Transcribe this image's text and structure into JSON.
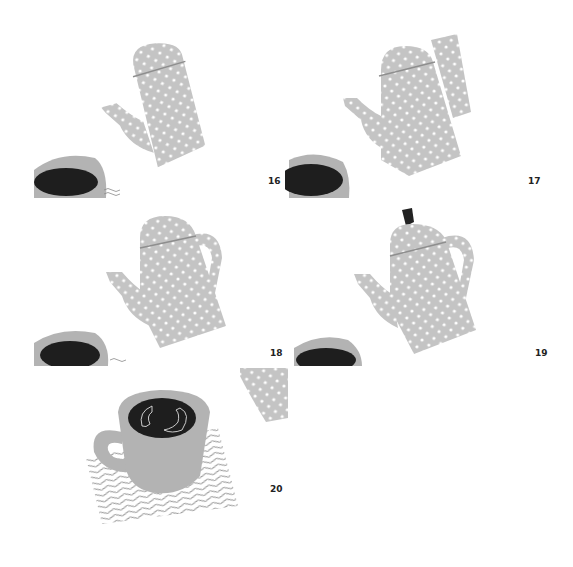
{
  "page": {
    "steps": [
      {
        "number": "16",
        "description": "Pot body and spout placed, lid line drawn"
      },
      {
        "number": "17",
        "description": "Handle strip added"
      },
      {
        "number": "18",
        "description": "Handle trimmed to shape"
      },
      {
        "number": "19",
        "description": "Knob added on lid"
      },
      {
        "number": "20",
        "description": "Cup with coffee on wavy-lined coaster"
      }
    ]
  },
  "colors": {
    "pot_gray": "#c4c4c4",
    "dot_white": "#ffffff",
    "lid_line": "#8e8e8e",
    "cup_gray": "#b3b3b3",
    "coffee_dark": "#1e1e1e",
    "wave_line": "#8a8a8a",
    "knob": "#222222",
    "background": "#ffffff"
  }
}
